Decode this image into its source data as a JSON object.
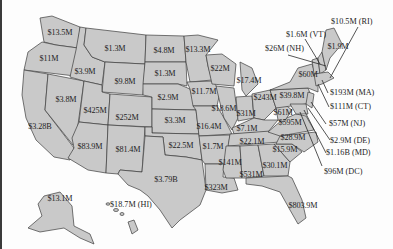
{
  "map": {
    "type": "us-state-values-map",
    "fill_color": "#c9c9c9",
    "border_color": "#3c3c3c",
    "states": [
      {
        "state": "WA",
        "value": "$13.5M"
      },
      {
        "state": "OR",
        "value": "$11M"
      },
      {
        "state": "CA",
        "value": "$3.28B"
      },
      {
        "state": "NV",
        "value": "$3.8M"
      },
      {
        "state": "ID",
        "value": "$3.9M"
      },
      {
        "state": "MT",
        "value": "$1.3M"
      },
      {
        "state": "WY",
        "value": "$9.8M"
      },
      {
        "state": "UT",
        "value": "$425M"
      },
      {
        "state": "CO",
        "value": "$252M"
      },
      {
        "state": "AZ",
        "value": "$83.9M"
      },
      {
        "state": "NM",
        "value": "$81.4M"
      },
      {
        "state": "ND",
        "value": "$4.8M"
      },
      {
        "state": "SD",
        "value": "$1.3M"
      },
      {
        "state": "NE",
        "value": "$2.9M"
      },
      {
        "state": "KS",
        "value": "$3.3M"
      },
      {
        "state": "OK",
        "value": "$22.5M"
      },
      {
        "state": "TX",
        "value": "$3.79B"
      },
      {
        "state": "MN",
        "value": "$13.3M"
      },
      {
        "state": "IA",
        "value": "$11.7M"
      },
      {
        "state": "MO",
        "value": "$16.4M"
      },
      {
        "state": "AR",
        "value": "$1.7M"
      },
      {
        "state": "LA",
        "value": "$323M"
      },
      {
        "state": "WI",
        "value": "$22M"
      },
      {
        "state": "IL",
        "value": "$18.6M"
      },
      {
        "state": "MI",
        "value": "$17.4M"
      },
      {
        "state": "IN",
        "value": "$31M"
      },
      {
        "state": "OH",
        "value": "$243M"
      },
      {
        "state": "KY",
        "value": "$7.1M"
      },
      {
        "state": "TN",
        "value": "$22.1M"
      },
      {
        "state": "MS",
        "value": "$141M"
      },
      {
        "state": "AL",
        "value": "$531M"
      },
      {
        "state": "GA",
        "value": "$30.1M"
      },
      {
        "state": "FL",
        "value": "$803.9M"
      },
      {
        "state": "SC",
        "value": "$15.9M"
      },
      {
        "state": "NC",
        "value": "$28.9M"
      },
      {
        "state": "VA",
        "value": "$595M"
      },
      {
        "state": "WV",
        "value": "$61M"
      },
      {
        "state": "PA",
        "value": "$39.8M"
      },
      {
        "state": "NY",
        "value": "$60M"
      },
      {
        "state": "ME",
        "value": "$1.9M"
      },
      {
        "state": "AK",
        "value": "$13.1M"
      }
    ],
    "callouts": [
      {
        "state": "RI",
        "label": "$10.5M (RI)"
      },
      {
        "state": "VT",
        "label": "$1.6M (VT)"
      },
      {
        "state": "NH",
        "label": "$26M (NH)"
      },
      {
        "state": "MA",
        "label": "$193M (MA)"
      },
      {
        "state": "CT",
        "label": "$111M (CT)"
      },
      {
        "state": "NJ",
        "label": "$57M (NJ)"
      },
      {
        "state": "DE",
        "label": "$2.9M (DE)"
      },
      {
        "state": "MD",
        "label": "$1.16B (MD)"
      },
      {
        "state": "DC",
        "label": "$96M (DC)"
      },
      {
        "state": "HI",
        "label": "$18.7M (HI)"
      }
    ]
  }
}
